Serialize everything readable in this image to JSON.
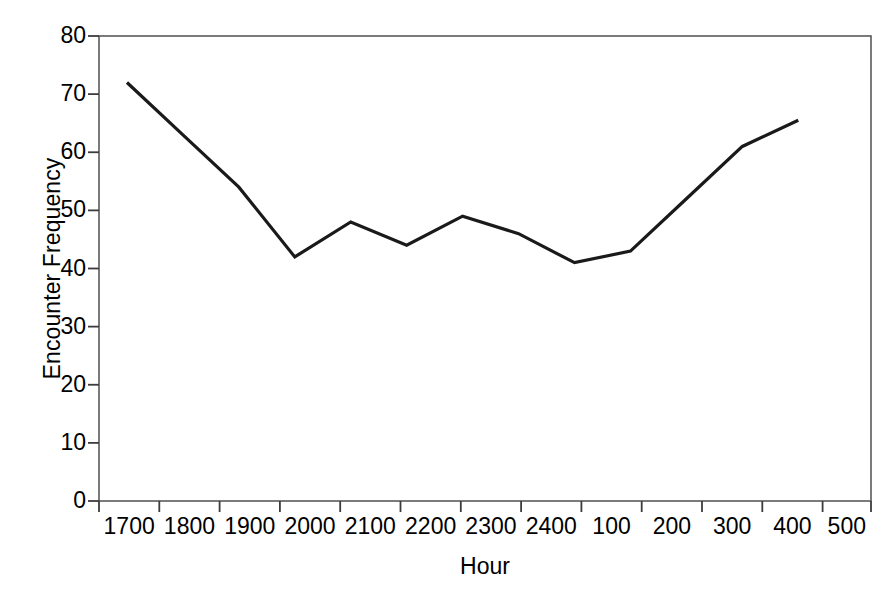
{
  "chart_data": {
    "type": "line",
    "title": "",
    "xlabel": "Hour",
    "ylabel": "Encounter Frequency",
    "categories": [
      "1700",
      "1800",
      "1900",
      "2000",
      "2100",
      "2200",
      "2300",
      "2400",
      "100",
      "200",
      "300",
      "400",
      "500"
    ],
    "values": [
      72,
      63,
      54,
      42,
      48,
      44,
      49,
      46,
      41,
      43,
      52,
      61,
      65.5
    ],
    "series": [
      {
        "name": "Encounter Frequency",
        "values": [
          72,
          63,
          54,
          42,
          48,
          44,
          49,
          46,
          41,
          43,
          52,
          61,
          65.5
        ]
      }
    ],
    "ylim": [
      0,
      80
    ],
    "yticks": [
      "0",
      "10",
      "20",
      "30",
      "40",
      "50",
      "60",
      "70",
      "80"
    ],
    "ytick_values": [
      0,
      10,
      20,
      30,
      40,
      50,
      60,
      70,
      80
    ],
    "grid": false,
    "legend": "none",
    "line_color": "#1a1a1a",
    "frame_color": "#555555",
    "background": "#ffffff"
  }
}
